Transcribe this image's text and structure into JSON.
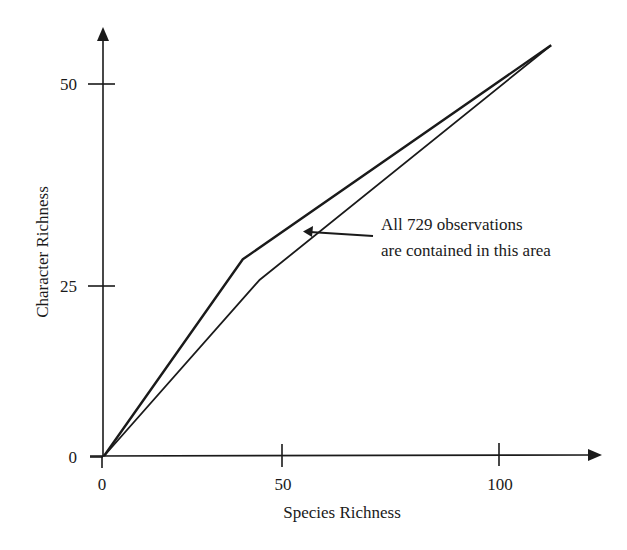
{
  "chart_data": {
    "type": "line",
    "title": "",
    "xlabel": "Species Richness",
    "ylabel": "Character Richness",
    "xlim": [
      0,
      120
    ],
    "ylim": [
      0,
      59
    ],
    "x_ticks": [
      0,
      50,
      100
    ],
    "y_ticks": [
      0,
      25,
      50
    ],
    "x_tick_labels": [
      "0",
      "50",
      "100"
    ],
    "y_tick_labels": [
      "0",
      "25",
      "50"
    ],
    "grid": false,
    "legend": null,
    "series": [
      {
        "name": "upper boundary",
        "points": [
          [
            0,
            0
          ],
          [
            39,
            28.3
          ],
          [
            112,
            54.8
          ]
        ]
      },
      {
        "name": "lower boundary",
        "points": [
          [
            0,
            0
          ],
          [
            43.6,
            25.7
          ],
          [
            112,
            54.8
          ]
        ]
      }
    ],
    "annotations": [
      {
        "text_lines": [
          "All 729 observations",
          "are contained in this area"
        ],
        "arrow_to": [
          55,
          29.3
        ]
      }
    ],
    "colors": {
      "line": "#1a1a1a",
      "background": "#ffffff"
    }
  }
}
